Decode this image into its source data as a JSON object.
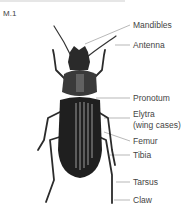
{
  "figure": {
    "id": "M.1",
    "labels": [
      {
        "key": "mandibles",
        "text": "Mandibles",
        "y": 21
      },
      {
        "key": "antenna",
        "text": "Antenna",
        "y": 41
      },
      {
        "key": "pronotum",
        "text": "Pronotum",
        "y": 94
      },
      {
        "key": "elytra",
        "text": "Elytra",
        "y": 110
      },
      {
        "key": "elytra_sub",
        "text": "(wing cases)",
        "y": 121
      },
      {
        "key": "femur",
        "text": "Femur",
        "y": 137
      },
      {
        "key": "tibia",
        "text": "Tibia",
        "y": 151
      },
      {
        "key": "tarsus",
        "text": "Tarsus",
        "y": 178
      },
      {
        "key": "claw",
        "text": "Claw",
        "y": 196
      }
    ]
  }
}
